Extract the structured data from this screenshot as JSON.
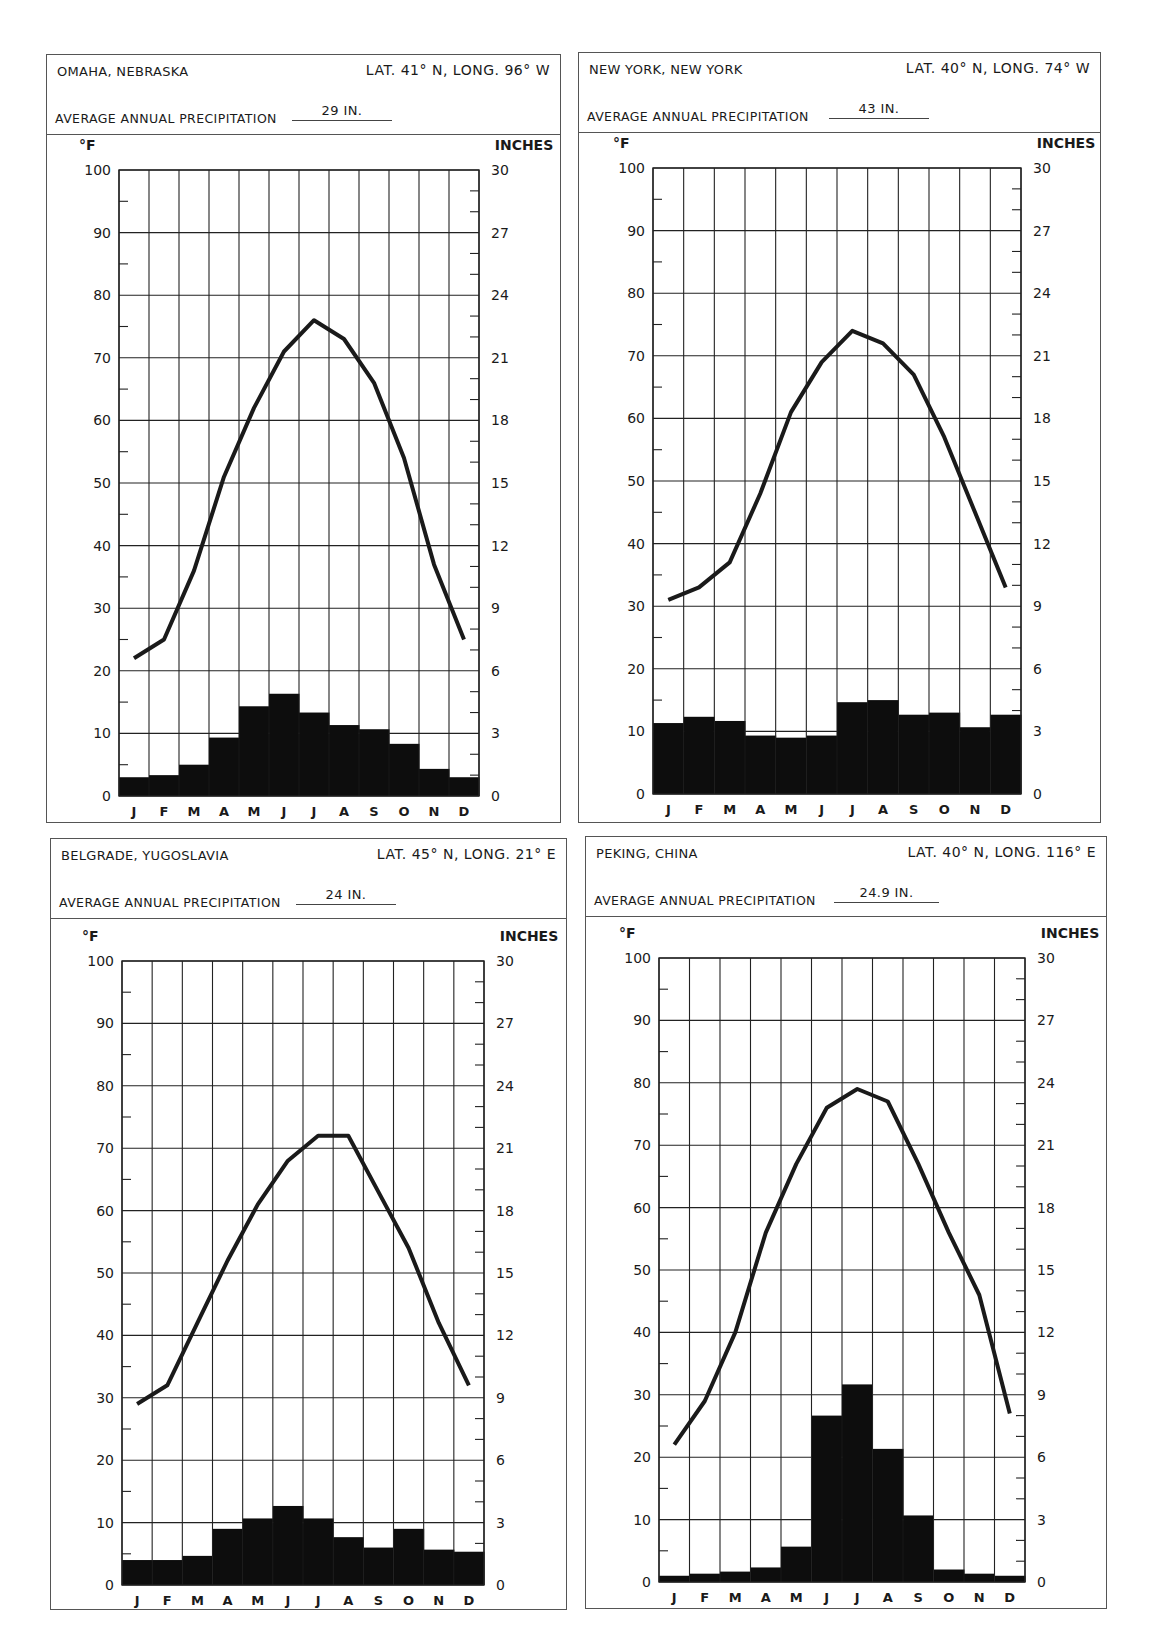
{
  "page": {
    "left_axis_unit": "°F",
    "right_axis_unit": "INCHES",
    "precip_label": "AVERAGE ANNUAL PRECIPITATION",
    "months": [
      "J",
      "F",
      "M",
      "A",
      "M",
      "J",
      "J",
      "A",
      "S",
      "O",
      "N",
      "D"
    ],
    "left_ticks": [
      "100",
      "90",
      "80",
      "70",
      "60",
      "50",
      "40",
      "30",
      "20",
      "10",
      "0"
    ],
    "right_ticks": [
      "30",
      "27",
      "24",
      "21",
      "18",
      "15",
      "12",
      "9",
      "6",
      "3",
      "0"
    ]
  },
  "cards": [
    {
      "city": "OMAHA, NEBRASKA",
      "latlong": "LAT. 41° N, LONG. 96° W",
      "annual_precip": "29 IN."
    },
    {
      "city": "NEW YORK, NEW YORK",
      "latlong": "LAT. 40° N, LONG. 74° W",
      "annual_precip": "43 IN."
    },
    {
      "city": "BELGRADE, YUGOSLAVIA",
      "latlong": "LAT. 45° N, LONG. 21° E",
      "annual_precip": "24 IN."
    },
    {
      "city": "PEKING, CHINA",
      "latlong": "LAT. 40° N, LONG. 116° E",
      "annual_precip": "24.9 IN."
    }
  ],
  "chart_data": [
    {
      "type": "bar+line",
      "title": "OMAHA, NEBRASKA",
      "subtitle": "LAT. 41° N, LONG. 96° W — AVERAGE ANNUAL PRECIPITATION 29 IN.",
      "categories": [
        "J",
        "F",
        "M",
        "A",
        "M",
        "J",
        "J",
        "A",
        "S",
        "O",
        "N",
        "D"
      ],
      "series": [
        {
          "name": "Temperature (°F)",
          "type": "line",
          "axis": "left",
          "values": [
            22,
            25,
            36,
            51,
            62,
            71,
            76,
            73,
            66,
            54,
            37,
            25
          ]
        },
        {
          "name": "Precipitation (inches)",
          "type": "bar",
          "axis": "right",
          "values": [
            0.9,
            1.0,
            1.5,
            2.8,
            4.3,
            4.9,
            4.0,
            3.4,
            3.2,
            2.5,
            1.3,
            0.9
          ]
        }
      ],
      "ylabel_left": "°F",
      "ylabel_right": "INCHES",
      "ylim_left": [
        0,
        100
      ],
      "ylim_right": [
        0,
        30
      ],
      "grid": true
    },
    {
      "type": "bar+line",
      "title": "NEW YORK, NEW YORK",
      "subtitle": "LAT. 40° N, LONG. 74° W — AVERAGE ANNUAL PRECIPITATION 43 IN.",
      "categories": [
        "J",
        "F",
        "M",
        "A",
        "M",
        "J",
        "J",
        "A",
        "S",
        "O",
        "N",
        "D"
      ],
      "series": [
        {
          "name": "Temperature (°F)",
          "type": "line",
          "axis": "left",
          "values": [
            31,
            33,
            37,
            48,
            61,
            69,
            74,
            72,
            67,
            57,
            45,
            33
          ]
        },
        {
          "name": "Precipitation (inches)",
          "type": "bar",
          "axis": "right",
          "values": [
            3.4,
            3.7,
            3.5,
            2.8,
            2.7,
            2.8,
            4.4,
            4.5,
            3.8,
            3.9,
            3.2,
            3.8
          ]
        }
      ],
      "ylabel_left": "°F",
      "ylabel_right": "INCHES",
      "ylim_left": [
        0,
        100
      ],
      "ylim_right": [
        0,
        30
      ],
      "grid": true
    },
    {
      "type": "bar+line",
      "title": "BELGRADE, YUGOSLAVIA",
      "subtitle": "LAT. 45° N, LONG. 21° E — AVERAGE ANNUAL PRECIPITATION 24 IN.",
      "categories": [
        "J",
        "F",
        "M",
        "A",
        "M",
        "J",
        "J",
        "A",
        "S",
        "O",
        "N",
        "D"
      ],
      "series": [
        {
          "name": "Temperature (°F)",
          "type": "line",
          "axis": "left",
          "values": [
            29,
            32,
            42,
            52,
            61,
            68,
            72,
            72,
            63,
            54,
            42,
            32
          ]
        },
        {
          "name": "Precipitation (inches)",
          "type": "bar",
          "axis": "right",
          "values": [
            1.2,
            1.2,
            1.4,
            2.7,
            3.2,
            3.8,
            3.2,
            2.3,
            1.8,
            2.7,
            1.7,
            1.6
          ]
        }
      ],
      "ylabel_left": "°F",
      "ylabel_right": "INCHES",
      "ylim_left": [
        0,
        100
      ],
      "ylim_right": [
        0,
        30
      ],
      "grid": true
    },
    {
      "type": "bar+line",
      "title": "PEKING, CHINA",
      "subtitle": "LAT. 40° N, LONG. 116° E — AVERAGE ANNUAL PRECIPITATION 24.9 IN.",
      "categories": [
        "J",
        "F",
        "M",
        "A",
        "M",
        "J",
        "J",
        "A",
        "S",
        "O",
        "N",
        "D"
      ],
      "series": [
        {
          "name": "Temperature (°F)",
          "type": "line",
          "axis": "left",
          "values": [
            22,
            29,
            40,
            56,
            67,
            76,
            79,
            77,
            67,
            56,
            46,
            27
          ]
        },
        {
          "name": "Precipitation (inches)",
          "type": "bar",
          "axis": "right",
          "values": [
            0.3,
            0.4,
            0.5,
            0.7,
            1.7,
            8.0,
            9.5,
            6.4,
            3.2,
            0.6,
            0.4,
            0.3
          ]
        }
      ],
      "ylabel_left": "°F",
      "ylabel_right": "INCHES",
      "ylim_left": [
        0,
        100
      ],
      "ylim_right": [
        0,
        30
      ],
      "grid": true
    }
  ]
}
